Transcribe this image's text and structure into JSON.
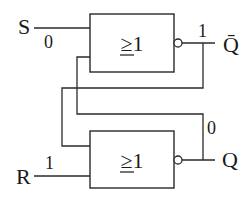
{
  "diagram": {
    "type": "RS latch from two NOR gates",
    "gates": [
      {
        "id": "top",
        "symbol": "≥1"
      },
      {
        "id": "bottom",
        "symbol": "≥1"
      }
    ],
    "inputs": {
      "s": {
        "label": "S",
        "value": "0"
      },
      "r": {
        "label": "R",
        "value": "1"
      }
    },
    "outputs": {
      "qbar": {
        "label": "Q̄",
        "value": "1"
      },
      "q": {
        "label": "Q",
        "value": "0"
      }
    }
  }
}
